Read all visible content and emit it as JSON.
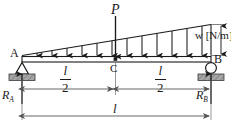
{
  "figure": {
    "width": 231,
    "height": 130,
    "background_color": "#ffffff",
    "line_color": "#1a1a1a",
    "hatch_fill_color": "#9a9a9a",
    "dimension_color": "#555555"
  },
  "labels": {
    "point_load": "P",
    "support_a": "A",
    "support_b": "B",
    "midpoint_c": "C",
    "distributed_load": "w [N/m]",
    "reaction_a": "R",
    "reaction_a_sub": "A",
    "reaction_b": "R",
    "reaction_b_sub": "B",
    "half_span_numerator": "l",
    "half_span_denominator": "2",
    "full_span": "l"
  },
  "supports": {
    "left": {
      "type": "pin",
      "label": "A",
      "symbol": "triangle-with-hatching"
    },
    "right": {
      "type": "roller",
      "label": "B",
      "symbol": "circle-with-hatching"
    }
  },
  "loads": {
    "point_load": {
      "symbol": "P",
      "location": "midspan C",
      "direction": "downward"
    },
    "distributed_load": {
      "symbol": "w [N/m]",
      "shape": "triangular",
      "value_at_a": 0,
      "value_at_b": "w",
      "direction": "downward",
      "arrow_count": 12
    }
  },
  "dimensions": [
    {
      "name": "left-half",
      "label": "l/2",
      "from": "A",
      "to": "C"
    },
    {
      "name": "right-half",
      "label": "l/2",
      "from": "C",
      "to": "B"
    },
    {
      "name": "full-span",
      "label": "l",
      "from": "A",
      "to": "B"
    }
  ],
  "reactions": [
    {
      "name": "R_A",
      "at": "A",
      "direction": "upward"
    },
    {
      "name": "R_B",
      "at": "B",
      "direction": "upward"
    }
  ]
}
